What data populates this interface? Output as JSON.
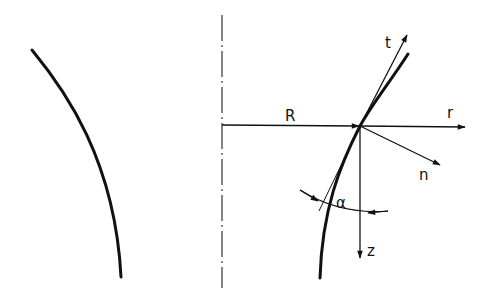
{
  "diagram": {
    "type": "geometry-sketch",
    "colors": {
      "ink": "#111111",
      "background": "#ffffff"
    },
    "labels": {
      "radius": "R",
      "radial_axis": "r",
      "tangent": "t",
      "normal": "n",
      "axial": "z",
      "angle": "α"
    },
    "elements": [
      {
        "id": "left-meridian-curve",
        "kind": "curve"
      },
      {
        "id": "symmetry-axis",
        "kind": "dash-dot line"
      },
      {
        "id": "radius-arrow",
        "kind": "arrow",
        "label": "R"
      },
      {
        "id": "r-axis-arrow",
        "kind": "arrow",
        "label": "r"
      },
      {
        "id": "t-arrow",
        "kind": "arrow",
        "label": "t"
      },
      {
        "id": "n-arrow",
        "kind": "arrow",
        "label": "n"
      },
      {
        "id": "z-arrow",
        "kind": "arrow",
        "label": "z"
      },
      {
        "id": "angle-arc",
        "kind": "double-arrow arc",
        "label": "α"
      },
      {
        "id": "right-meridian-curve",
        "kind": "curve"
      },
      {
        "id": "tangent-line",
        "kind": "thin line"
      }
    ]
  }
}
